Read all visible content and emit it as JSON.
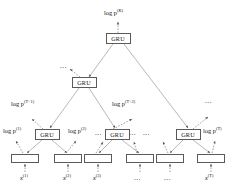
{
  "figure": {
    "type": "hierarchical-gru-tree-diagram",
    "width": 237,
    "height": 189,
    "background": "#ffffff",
    "line_color": "#8c8c8c",
    "box_border_color": "#5a5a5a",
    "text_color": "#111111"
  },
  "nodes": {
    "root": {
      "label": "GRU",
      "x": 118,
      "y": 38
    },
    "level2": [
      {
        "label": "GRU",
        "x": 84,
        "y": 82
      }
    ],
    "level3": [
      {
        "label": "GRU",
        "x": 47,
        "y": 134
      },
      {
        "label": "GRU",
        "x": 117,
        "y": 134
      },
      {
        "label": "GRU",
        "x": 188,
        "y": 134
      }
    ],
    "leaves": [
      {
        "label": "",
        "x": 25,
        "y": 158
      },
      {
        "label": "",
        "x": 68,
        "y": 158
      },
      {
        "label": "",
        "x": 98,
        "y": 158
      },
      {
        "label": "",
        "x": 140,
        "y": 158
      },
      {
        "label": "",
        "x": 170,
        "y": 158
      },
      {
        "label": "",
        "x": 211,
        "y": 158
      }
    ]
  },
  "labels": {
    "root_output": {
      "base": "log p",
      "sup": "(K)",
      "x": 104,
      "y": 10
    },
    "level2_output": {
      "text": "...",
      "x": 64,
      "y": 67
    },
    "level3_outputs": [
      {
        "base": "log p",
        "sup": "(T+1)",
        "x": 14,
        "y": 101
      },
      {
        "base": "log p",
        "sup": "(T+2)",
        "x": 114,
        "y": 101
      },
      {
        "text": "...",
        "x": 206,
        "y": 102
      }
    ],
    "leaf_outputs": [
      {
        "base": "log p",
        "sup": "(1)",
        "x": 6,
        "y": 128
      },
      {
        "base": "log p",
        "sup": "(2)",
        "x": 70,
        "y": 128
      },
      {
        "text": "...",
        "x": 97,
        "y": 130
      },
      {
        "text": "...",
        "x": 131,
        "y": 130
      },
      {
        "text": "...",
        "x": 145,
        "y": 130
      },
      {
        "base": "log p",
        "sup": "(T)",
        "x": 204,
        "y": 128
      }
    ],
    "inputs": [
      {
        "base": "x",
        "sup": "(1)",
        "x": 22,
        "y": 175
      },
      {
        "base": "x",
        "sup": "(2)",
        "x": 65,
        "y": 175
      },
      {
        "base": "x",
        "sup": "(3)",
        "x": 95,
        "y": 175
      },
      {
        "text": "...",
        "x": 136,
        "y": 177
      },
      {
        "text": "...",
        "x": 166,
        "y": 177
      },
      {
        "base": "x",
        "sup": "(T)",
        "x": 207,
        "y": 175
      }
    ]
  }
}
